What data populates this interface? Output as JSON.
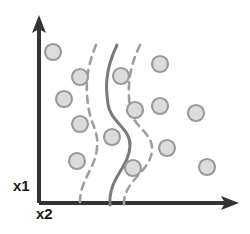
{
  "figure": {
    "title": "",
    "background_color": "#ffffff"
  },
  "axes": {
    "y_axis": {
      "label": "x1",
      "color": "#333333",
      "x": 39,
      "y_top": 18,
      "y_bottom": 203,
      "arrow": "up-arrow-icon"
    },
    "x_axis": {
      "label": "x2",
      "color": "#333333",
      "y": 203,
      "x_left": 39,
      "x_right": 237,
      "arrow": "right-arrow-icon"
    }
  },
  "chart_data": {
    "type": "scatter",
    "title": "",
    "xlabel": "x2",
    "ylabel": "x1",
    "xlim": [
      39,
      237
    ],
    "ylim": [
      18,
      203
    ],
    "grid": false,
    "legend": "none",
    "marker_style": {
      "shape": "circle",
      "fill_color": "#dcdcdc",
      "stroke_color": "#9a9a9a",
      "radius": 8
    },
    "points": [
      {
        "x": 53,
        "y": 52
      },
      {
        "x": 80,
        "y": 77
      },
      {
        "x": 64,
        "y": 99
      },
      {
        "x": 80,
        "y": 124
      },
      {
        "x": 77,
        "y": 161
      },
      {
        "x": 112,
        "y": 137
      },
      {
        "x": 121,
        "y": 76
      },
      {
        "x": 135,
        "y": 110
      },
      {
        "x": 133,
        "y": 168
      },
      {
        "x": 160,
        "y": 64
      },
      {
        "x": 160,
        "y": 106
      },
      {
        "x": 167,
        "y": 148
      },
      {
        "x": 196,
        "y": 113
      },
      {
        "x": 207,
        "y": 167
      }
    ],
    "annotations": [
      {
        "name": "decision-boundary",
        "style": "solid",
        "color": "#7a7a7a",
        "path": "M 117,45 C 104,72 106,90 108,104 C 110,122 131,128 130,146 C 129,168 108,178 110,205"
      },
      {
        "name": "margin-boundary-left",
        "style": "dashed",
        "color": "#9e9e9e",
        "path": "M 96,45 C 85,72 86,90 88,104 C 90,124 99,130 97,148 C 95,170 79,180 80,205"
      },
      {
        "name": "margin-boundary-right",
        "style": "dashed",
        "color": "#9e9e9e",
        "path": "M 140,45 C 127,72 128,92 130,108 C 133,128 153,132 152,150 C 151,172 123,180 124,205"
      }
    ]
  }
}
